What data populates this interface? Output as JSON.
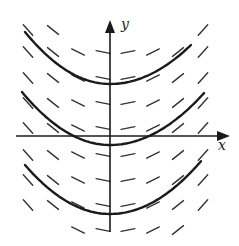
{
  "diagram": {
    "type": "slope-field",
    "colors": {
      "background": "#ffffff",
      "ink": "#1a1a1a",
      "marks": "#333333"
    },
    "axes": {
      "x_label": "x",
      "y_label": "y",
      "origin_px": [
        110,
        136
      ],
      "x_axis": {
        "from_px": [
          16,
          136
        ],
        "to_px": [
          230,
          136
        ]
      },
      "y_axis": {
        "from_px": [
          110,
          232
        ],
        "to_px": [
          110,
          20
        ]
      }
    },
    "solution_curves": [
      {
        "name": "upper",
        "start_px": [
          25,
          32
        ],
        "vertex_px": [
          110,
          84
        ],
        "end_px": [
          192,
          44
        ]
      },
      {
        "name": "middle",
        "start_px": [
          22,
          92
        ],
        "vertex_px": [
          110,
          145
        ],
        "end_px": [
          205,
          92
        ]
      },
      {
        "name": "lower",
        "start_px": [
          25,
          165
        ],
        "vertex_px": [
          110,
          214
        ],
        "end_px": [
          202,
          160
        ]
      }
    ],
    "slope_marks": {
      "columns_px": [
        28,
        53,
        78,
        103,
        128,
        153,
        178,
        203
      ],
      "rows_px": [
        30,
        52,
        78,
        103,
        128,
        155,
        180,
        205,
        230
      ],
      "slopes_by_column": [
        1.1,
        0.8,
        0.5,
        0.2,
        -0.2,
        -0.5,
        -0.8,
        -1.1
      ],
      "half_length_px": 7
    }
  }
}
